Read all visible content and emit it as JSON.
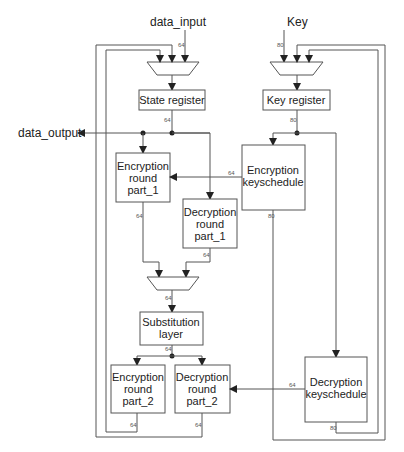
{
  "diagram": {
    "inputs": {
      "data_input": "data_input",
      "key": "Key"
    },
    "outputs": {
      "data_output": "data_output"
    },
    "blocks": {
      "state_register": [
        "State register"
      ],
      "key_register": [
        "Key register"
      ],
      "enc_round_1": [
        "Encryption",
        "round",
        "part_1"
      ],
      "dec_round_1": [
        "Decryption",
        "round",
        "part_1"
      ],
      "enc_keyschedule": [
        "Encryption",
        "keyschedule"
      ],
      "substitution": [
        "Substitution",
        "layer"
      ],
      "enc_round_2": [
        "Encryption",
        "round",
        "part_2"
      ],
      "dec_round_2": [
        "Decryption",
        "round",
        "part_2"
      ],
      "dec_keyschedule": [
        "Decryption",
        "keyschedule"
      ]
    },
    "bus_widths": {
      "data_in": "64",
      "key_in": "80",
      "state_out": "64",
      "key_reg_out": "80",
      "enc_ks_to_round": "64",
      "enc_r1_out": "64",
      "dec_r1_out": "64",
      "enc_ks_out": "80",
      "mux_out": "64",
      "sub_out": "64",
      "dec_ks_to_round": "64",
      "enc_r2_out": "64",
      "dec_r2_out": "64",
      "dec_ks_out": "80"
    },
    "colors": {
      "line": "#555555",
      "text": "#222222",
      "background": "#ffffff"
    }
  }
}
